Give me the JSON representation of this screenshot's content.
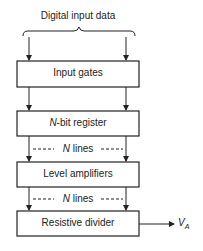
{
  "diagram": {
    "input_label": "Digital input data",
    "blocks": [
      {
        "label": "Input gates"
      },
      {
        "label_prefix": "N",
        "label": "-bit register"
      },
      {
        "label": "Level amplifiers"
      },
      {
        "label": "Resistive divider"
      }
    ],
    "connectors": [
      {
        "prefix": "N",
        "label": "lines"
      },
      {
        "prefix": "N",
        "label": "lines"
      }
    ],
    "output": {
      "symbol": "V",
      "subscript": "A"
    },
    "colors": {
      "line": "#222222",
      "background": "#ffffff"
    }
  }
}
